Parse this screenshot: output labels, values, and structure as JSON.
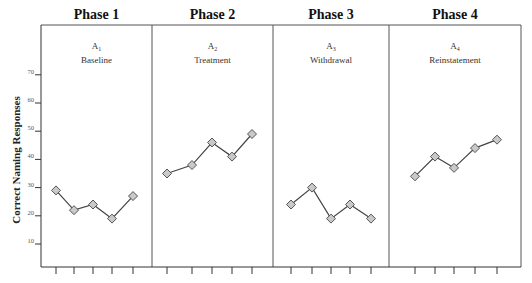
{
  "chart_data": {
    "type": "line",
    "title": "",
    "xlabel": "",
    "ylabel": "Correct Naming Responses",
    "ylim": [
      0,
      80
    ],
    "yticks": [
      10,
      20,
      30,
      40,
      50,
      60,
      70
    ],
    "grid": false,
    "legend": null,
    "phases": [
      {
        "title": "Phase 1",
        "code": "A",
        "code_sub": "1",
        "label": "Baseline",
        "values": [
          29,
          22,
          24,
          19,
          27
        ]
      },
      {
        "title": "Phase 2",
        "code": "A",
        "code_sub": "2",
        "label": "Treatment",
        "values": [
          35,
          38,
          46,
          41,
          49
        ]
      },
      {
        "title": "Phase 3",
        "code": "A",
        "code_sub": "3",
        "label": "Withdrawal",
        "values": [
          24,
          30,
          19,
          24,
          19
        ]
      },
      {
        "title": "Phase 4",
        "code": "A",
        "code_sub": "4",
        "label": "Reinstatement",
        "values": [
          34,
          41,
          37,
          44,
          47
        ]
      }
    ],
    "sessions_per_phase": 5,
    "marker": "diamond",
    "colors": {
      "marker_fill": "#c9c9c9",
      "marker_stroke": "#555555",
      "line": "#444444"
    }
  }
}
